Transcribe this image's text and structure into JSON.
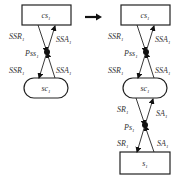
{
  "diagram": {
    "transform_arrow": "right-arrow",
    "left": {
      "top_node": {
        "label": "cs",
        "sub": "1",
        "shape": "rectangle"
      },
      "bottom_node": {
        "label": "sc",
        "sub": "1",
        "shape": "rounded"
      },
      "junction": {
        "label": "Pss",
        "sub": "1"
      },
      "edges": {
        "top_left": {
          "label": "SSR",
          "sub": "1"
        },
        "top_right": {
          "label": "SSA",
          "sub": "1"
        },
        "bottom_left": {
          "label": "SSR",
          "sub": "1"
        },
        "bottom_right": {
          "label": "SSA",
          "sub": "1"
        }
      }
    },
    "right": {
      "top_node": {
        "label": "cs",
        "sub": "1",
        "shape": "rectangle"
      },
      "middle_node": {
        "label": "sc",
        "sub": "1",
        "shape": "rounded"
      },
      "bottom_node": {
        "label": "s",
        "sub": "1",
        "shape": "rectangle"
      },
      "upper_junction": {
        "label": "Pss",
        "sub": "1"
      },
      "lower_junction": {
        "label": "Ps",
        "sub": "1"
      },
      "upper_edges": {
        "top_left": {
          "label": "SSR",
          "sub": "1"
        },
        "top_right": {
          "label": "SSA",
          "sub": "1"
        },
        "bottom_left": {
          "label": "SSR",
          "sub": "1"
        },
        "bottom_right": {
          "label": "SSA",
          "sub": "1"
        }
      },
      "lower_edges": {
        "top_left": {
          "label": "SR",
          "sub": "1"
        },
        "top_right": {
          "label": "SA",
          "sub": "1"
        },
        "bottom_left": {
          "label": "SR",
          "sub": "1"
        },
        "bottom_right": {
          "label": "SA",
          "sub": "1"
        }
      }
    }
  }
}
